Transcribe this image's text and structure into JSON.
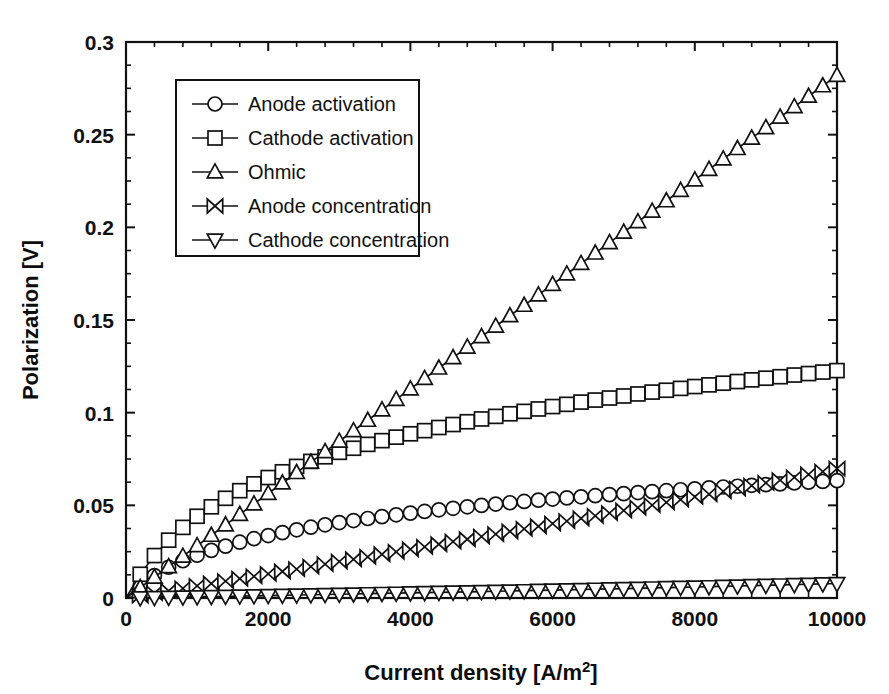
{
  "chart_data": {
    "type": "line",
    "title": "",
    "xlabel": "Current density [A/m2]",
    "xlabel_base": "Current density [A/m",
    "xlabel_sup": "2",
    "xlabel_tail": "]",
    "ylabel": "Polarization [V]",
    "xlim": [
      0,
      10000
    ],
    "ylim": [
      0,
      0.3
    ],
    "xticks": [
      0,
      2000,
      4000,
      6000,
      8000,
      10000
    ],
    "xtick_labels": [
      "0",
      "2000",
      "4000",
      "6000",
      "8000",
      "10000"
    ],
    "yticks": [
      0,
      0.05,
      0.1,
      0.15,
      0.2,
      0.25,
      0.3
    ],
    "ytick_labels": [
      "0",
      "0.05",
      "0.1",
      "0.15",
      "0.2",
      "0.25",
      "0.3"
    ],
    "x_minor_tick_interval": 400,
    "y_minor_tick_interval": 0.0125,
    "grid": false,
    "legend_position": "upper-left-inset",
    "x": [
      0,
      200,
      400,
      600,
      800,
      1000,
      1200,
      1400,
      1600,
      1800,
      2000,
      2200,
      2400,
      2600,
      2800,
      3000,
      3200,
      3400,
      3600,
      3800,
      4000,
      4200,
      4400,
      4600,
      4800,
      5000,
      5200,
      5400,
      5600,
      5800,
      6000,
      6200,
      6400,
      6600,
      6800,
      7000,
      7200,
      7400,
      7600,
      7800,
      8000,
      8200,
      8400,
      8600,
      8800,
      9000,
      9200,
      9400,
      9600,
      9800,
      10000
    ],
    "series": [
      {
        "name": "Anode activation",
        "marker": "circle",
        "color": "#111111",
        "values": [
          0,
          0.0069,
          0.0121,
          0.0166,
          0.0201,
          0.0231,
          0.0257,
          0.028,
          0.0301,
          0.032,
          0.0337,
          0.0353,
          0.0368,
          0.0382,
          0.0395,
          0.0407,
          0.0418,
          0.0429,
          0.0439,
          0.0449,
          0.0458,
          0.0467,
          0.0476,
          0.0484,
          0.0492,
          0.05,
          0.0507,
          0.0514,
          0.0521,
          0.0528,
          0.0534,
          0.054,
          0.0546,
          0.0552,
          0.0558,
          0.0563,
          0.0569,
          0.0574,
          0.0579,
          0.0584,
          0.0589,
          0.0594,
          0.0599,
          0.0603,
          0.0608,
          0.0612,
          0.0616,
          0.0621,
          0.0625,
          0.0629,
          0.0633
        ]
      },
      {
        "name": "Cathode activation",
        "marker": "square",
        "color": "#111111",
        "values": [
          0,
          0.0128,
          0.0229,
          0.0312,
          0.0381,
          0.0441,
          0.0492,
          0.0538,
          0.0579,
          0.0616,
          0.065,
          0.0681,
          0.071,
          0.0737,
          0.0762,
          0.0786,
          0.0808,
          0.0829,
          0.0849,
          0.0868,
          0.0886,
          0.0903,
          0.092,
          0.0936,
          0.0951,
          0.0966,
          0.098,
          0.0994,
          0.1007,
          0.102,
          0.1033,
          0.1045,
          0.1057,
          0.1068,
          0.1079,
          0.109,
          0.1101,
          0.1111,
          0.1121,
          0.1131,
          0.1141,
          0.115,
          0.1159,
          0.1168,
          0.1177,
          0.1186,
          0.1194,
          0.1203,
          0.1211,
          0.1219,
          0.1227
        ]
      },
      {
        "name": "Ohmic",
        "marker": "triangle-up",
        "color": "#111111",
        "values": [
          0,
          0.00564,
          0.01128,
          0.01692,
          0.02256,
          0.0282,
          0.03384,
          0.03948,
          0.04512,
          0.05076,
          0.0564,
          0.06204,
          0.06768,
          0.07332,
          0.07896,
          0.0846,
          0.09024,
          0.09588,
          0.10152,
          0.10716,
          0.1128,
          0.11844,
          0.12408,
          0.12972,
          0.13536,
          0.141,
          0.14664,
          0.15228,
          0.15792,
          0.16356,
          0.1692,
          0.17484,
          0.18048,
          0.18612,
          0.19176,
          0.1974,
          0.20304,
          0.20868,
          0.21432,
          0.21996,
          0.2256,
          0.23124,
          0.23688,
          0.24252,
          0.24816,
          0.2538,
          0.25944,
          0.26508,
          0.27072,
          0.27636,
          0.282
        ]
      },
      {
        "name": "Anode concentration",
        "marker": "bowtie",
        "color": "#111111",
        "values": [
          0,
          0.0013,
          0.0026,
          0.0039,
          0.0052,
          0.0065,
          0.0078,
          0.0091,
          0.0104,
          0.0117,
          0.013,
          0.0143,
          0.0156,
          0.0169,
          0.0183,
          0.0196,
          0.0209,
          0.0222,
          0.0236,
          0.0249,
          0.0263,
          0.0276,
          0.029,
          0.0304,
          0.0317,
          0.0331,
          0.0345,
          0.0359,
          0.0373,
          0.0387,
          0.0401,
          0.0415,
          0.0429,
          0.0443,
          0.0458,
          0.0472,
          0.0487,
          0.0501,
          0.0516,
          0.0531,
          0.0546,
          0.056,
          0.0575,
          0.059,
          0.0606,
          0.0621,
          0.0636,
          0.0651,
          0.0667,
          0.0682,
          0.0698
        ]
      },
      {
        "name": "Cathode concentration",
        "marker": "triangle-down",
        "color": "#111111",
        "values": [
          0,
          0.00013,
          0.00026,
          0.00039,
          0.00053,
          0.00066,
          0.00079,
          0.00093,
          0.00106,
          0.0012,
          0.00133,
          0.00147,
          0.00161,
          0.00175,
          0.00189,
          0.00203,
          0.00217,
          0.00231,
          0.00245,
          0.0026,
          0.00274,
          0.00289,
          0.00304,
          0.00318,
          0.00333,
          0.00348,
          0.00364,
          0.00379,
          0.00394,
          0.0041,
          0.00426,
          0.00442,
          0.00458,
          0.00474,
          0.0049,
          0.00507,
          0.00524,
          0.00541,
          0.00558,
          0.00575,
          0.00593,
          0.00611,
          0.00629,
          0.00647,
          0.00666,
          0.00685,
          0.00704,
          0.00723,
          0.00743,
          0.00763,
          0.00783
        ]
      }
    ],
    "legend_entries": [
      "Anode activation",
      "Cathode activation",
      "Ohmic",
      "Anode concentration",
      "Cathode concentration"
    ]
  }
}
